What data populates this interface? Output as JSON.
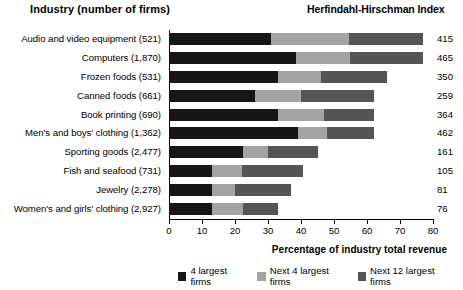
{
  "headers": {
    "industry": "Industry (number of firms)",
    "hhi": "Herfindahl-Hirschman Index"
  },
  "chart_data": {
    "type": "bar",
    "orientation": "horizontal",
    "stacked": true,
    "title": "",
    "xlabel": "Percentage of industry total revenue",
    "ylabel": "Industry (number of firms)",
    "xlim": [
      0,
      80
    ],
    "xticks": [
      0,
      10,
      20,
      30,
      40,
      50,
      60,
      70,
      80
    ],
    "grid": false,
    "legend_position": "bottom",
    "colors": {
      "series1": "#161616",
      "series2": "#a3a3a3",
      "series3": "#555555"
    },
    "categories": [
      "Audio and video equipment  (521)",
      "Computers  (1,870)",
      "Frozen foods  (531)",
      "Canned foods  (661)",
      "Book printing  (690)",
      "Men's and boys' clothing  (1,362)",
      "Sporting goods  (2,477)",
      "Fish and seafood  (731)",
      "Jewelry  (2,278)",
      "Women's and girls' clothing  (2,927)"
    ],
    "series": [
      {
        "name": "4 largest firms",
        "values": [
          31,
          38.5,
          33,
          26,
          33,
          39,
          22.5,
          13,
          13,
          13
        ]
      },
      {
        "name": "Next 4 largest firms",
        "values": [
          23.5,
          16.5,
          13,
          14,
          14,
          9,
          7.5,
          9,
          7,
          9.5
        ]
      },
      {
        "name": "Next 12 largest firms",
        "values": [
          22.5,
          22,
          20,
          22,
          15,
          14,
          15,
          18.5,
          17,
          10.5
        ]
      }
    ],
    "totals": [
      77,
      77,
      66,
      62,
      62,
      62,
      45,
      40.5,
      37,
      33
    ],
    "annotations": {
      "label": "Herfindahl-Hirschman Index",
      "values": [
        415,
        465,
        350,
        259,
        364,
        462,
        161,
        105,
        81,
        76
      ]
    }
  },
  "legend": [
    "4 largest firms",
    "Next 4 largest firms",
    "Next 12 largest firms"
  ]
}
